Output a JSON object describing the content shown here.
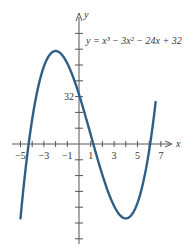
{
  "chart_data": {
    "type": "line",
    "title": "",
    "equation_label": "y = x³ − 3x² − 24x + 32",
    "xlabel": "x",
    "ylabel": "y",
    "x_tick_labels": [
      "-5",
      "-3",
      "-1",
      "1",
      "3",
      "5",
      "7"
    ],
    "x_tick_values": [
      -5,
      -3,
      -1,
      1,
      3,
      5,
      7
    ],
    "y_tick_labels": [
      "32"
    ],
    "y_tick_values": [
      32
    ],
    "xlim": [
      -6,
      8.5
    ],
    "ylim": [
      -80,
      95
    ],
    "grid": false,
    "line_color": "#2f5f86",
    "series": [
      {
        "name": "y = x^3 - 3x^2 - 24x + 32",
        "x": [
          -5,
          -4.5,
          -4,
          -3.5,
          -3,
          -2.5,
          -2,
          -1.5,
          -1,
          -0.5,
          0,
          0.5,
          1,
          1.5,
          2,
          2.5,
          3,
          3.5,
          4,
          4.5,
          5,
          5.5,
          6,
          6.5
        ],
        "values": [
          -28,
          9.9,
          32,
          41.6,
          50,
          56.4,
          60,
          60.1,
          52,
          43.4,
          32,
          19.6,
          6,
          -8.1,
          -20,
          -29.9,
          -40,
          -44.4,
          -48,
          -44.9,
          -38,
          -25.6,
          8,
          30.6
        ]
      }
    ]
  }
}
